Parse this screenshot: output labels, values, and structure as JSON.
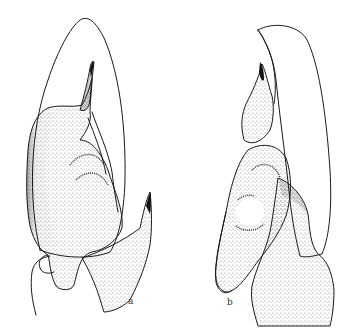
{
  "figure": {
    "panels": [
      {
        "id": "a",
        "label": "a",
        "description": "stippled illustration, left view"
      },
      {
        "id": "b",
        "label": "b",
        "description": "stippled illustration, right view"
      }
    ],
    "colors": {
      "ink": "#1a1a1a",
      "background": "#ffffff"
    }
  }
}
